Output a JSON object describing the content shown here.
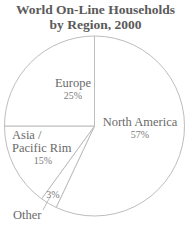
{
  "chart_data": {
    "type": "pie",
    "title": "World On-Line Households by Region, 2000",
    "title_lines": [
      "World On-Line Households",
      "by Region, 2000"
    ],
    "categories": [
      "North America",
      "Other",
      "Asia / Pacific Rim",
      "Europe"
    ],
    "values": [
      57,
      3,
      15,
      25
    ],
    "unit": "%",
    "start_angle": "12 o'clock",
    "direction": "clockwise",
    "legend": "none (direct labels)",
    "slices": [
      {
        "label": "North America",
        "label_lines": [
          "North America"
        ],
        "value": 57,
        "pct_text": "57%"
      },
      {
        "label": "Other",
        "label_lines": [
          "Other"
        ],
        "value": 3,
        "pct_text": "3%"
      },
      {
        "label": "Asia / Pacific Rim",
        "label_lines": [
          "Asia /",
          "Pacific Rim"
        ],
        "value": 15,
        "pct_text": "15%"
      },
      {
        "label": "Europe",
        "label_lines": [
          "Europe"
        ],
        "value": 25,
        "pct_text": "25%"
      }
    ]
  },
  "colors": {
    "title": "#5a5a5a",
    "label": "#6a6a6a",
    "line": "#bdbdbd",
    "fill": "#ffffff"
  }
}
